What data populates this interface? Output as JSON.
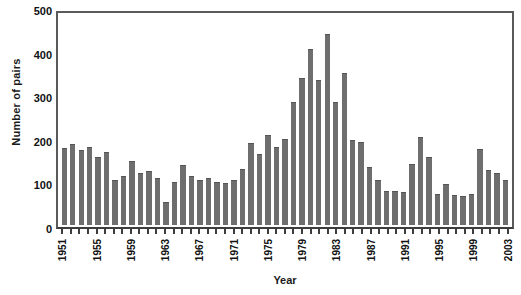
{
  "chart_data": {
    "type": "bar",
    "title": "",
    "xlabel": "Year",
    "ylabel": "Number of pairs",
    "ylim": [
      0,
      500
    ],
    "yticks": [
      0,
      100,
      200,
      300,
      400,
      500
    ],
    "grid": false,
    "legend": null,
    "bar_color": "#6e6e6e",
    "xtick_label_interval": 4,
    "categories": [
      "1951",
      "1952",
      "1953",
      "1954",
      "1955",
      "1956",
      "1957",
      "1958",
      "1959",
      "1960",
      "1961",
      "1962",
      "1963",
      "1964",
      "1965",
      "1966",
      "1967",
      "1968",
      "1969",
      "1970",
      "1971",
      "1972",
      "1973",
      "1974",
      "1975",
      "1976",
      "1977",
      "1978",
      "1979",
      "1980",
      "1981",
      "1982",
      "1983",
      "1984",
      "1985",
      "1986",
      "1987",
      "1988",
      "1989",
      "1990",
      "1991",
      "1992",
      "1993",
      "1994",
      "1995",
      "1996",
      "1997",
      "1998",
      "1999",
      "2000",
      "2001",
      "2002",
      "2003"
    ],
    "values": [
      183,
      193,
      178,
      185,
      162,
      175,
      106,
      117,
      152,
      124,
      128,
      112,
      55,
      102,
      142,
      117,
      108,
      112,
      102,
      100,
      108,
      133,
      195,
      168,
      215,
      185,
      205,
      292,
      350,
      420,
      345,
      455,
      292,
      362,
      202,
      198,
      138,
      108,
      82,
      80,
      78,
      145,
      210,
      162,
      75,
      97,
      72,
      70,
      73,
      182,
      132,
      125,
      108
    ]
  }
}
